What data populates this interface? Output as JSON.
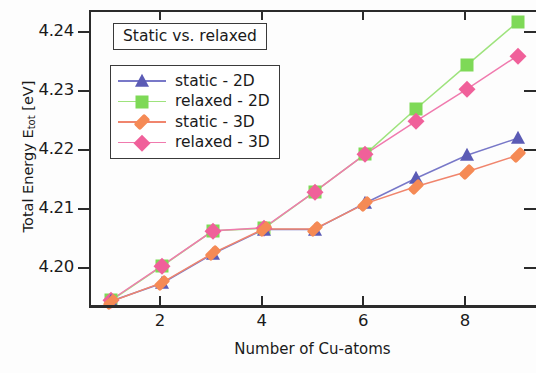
{
  "chart_data": {
    "type": "line",
    "title": "Static vs. relaxed",
    "xlabel": "Number of Cu-atoms",
    "ylabel": "Total Energy E_tot [eV]",
    "ylabel_main": "Total Energy E",
    "ylabel_sub": "tot",
    "ylabel_unit": " [eV]",
    "x": [
      1,
      2,
      3,
      4,
      5,
      6,
      7,
      8,
      9
    ],
    "xlim": [
      0.6,
      9.4
    ],
    "ylim": [
      4.1935,
      4.2437
    ],
    "xticks": [
      2,
      4,
      6,
      8
    ],
    "xtick_labels": [
      "2",
      "4",
      "6",
      "8"
    ],
    "yticks": [
      4.2,
      4.21,
      4.22,
      4.23,
      4.24
    ],
    "ytick_labels": [
      "4.20",
      "4.21",
      "4.22",
      "4.23",
      "4.24"
    ],
    "grid": false,
    "legend_position": "upper-left",
    "series": [
      {
        "name": "static - 2D",
        "marker": "triangle",
        "color": "#5b5bb5",
        "line_color": "#7878c8",
        "values": [
          4.1947,
          4.1977,
          4.2027,
          4.2068,
          4.2068,
          4.2113,
          4.2155,
          4.2194,
          4.2223
        ]
      },
      {
        "name": "relaxed - 2D",
        "marker": "square",
        "color": "#7ed957",
        "line_color": "#9ee37d",
        "values": [
          4.1948,
          4.2006,
          4.2066,
          4.207,
          4.2132,
          4.2196,
          4.2273,
          4.2347,
          4.242
        ]
      },
      {
        "name": "static - 3D",
        "marker": "diamond-narrow",
        "color": "#f58a55",
        "line_color": "#f0856d",
        "values": [
          4.1946,
          4.1978,
          4.2028,
          4.2069,
          4.2069,
          4.2112,
          4.2141,
          4.2166,
          4.2194
        ]
      },
      {
        "name": "relaxed - 3D",
        "marker": "diamond",
        "color": "#f0609a",
        "line_color": "#f07aae",
        "values": [
          4.1949,
          4.2007,
          4.2066,
          4.2071,
          4.2132,
          4.2196,
          4.2252,
          4.2306,
          4.2363
        ]
      }
    ]
  },
  "axis_colors": {
    "frame": "#2b2b2b",
    "text": "#1a1a1a",
    "background": "#fdfdfd"
  }
}
